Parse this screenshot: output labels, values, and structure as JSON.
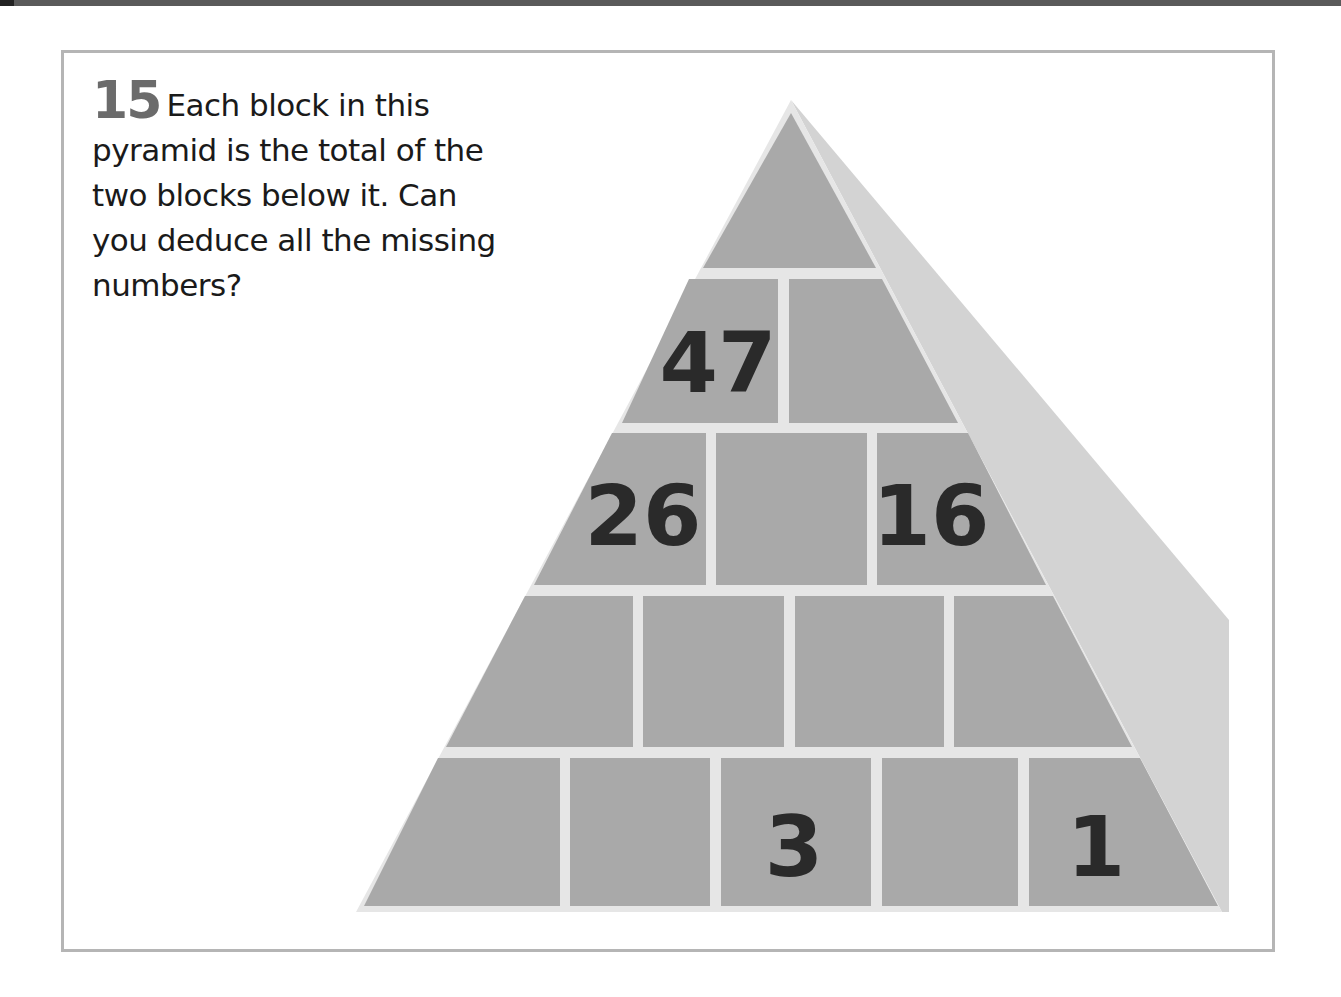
{
  "puzzle": {
    "number": "15",
    "text": "Each block in this pyramid is the total of the two blocks below it. Can you deduce all the missing numbers?",
    "lines": [
      "Each block in this",
      "pyramid is the total of the",
      "two blocks below it. Can",
      "you deduce all the missing",
      "numbers?"
    ]
  },
  "pyramid": {
    "rows": [
      {
        "row": 1,
        "cells": [
          ""
        ]
      },
      {
        "row": 2,
        "cells": [
          "47",
          ""
        ]
      },
      {
        "row": 3,
        "cells": [
          "26",
          "",
          "16"
        ]
      },
      {
        "row": 4,
        "cells": [
          "",
          "",
          "",
          ""
        ]
      },
      {
        "row": 5,
        "cells": [
          "",
          "",
          "3",
          "",
          "1"
        ]
      }
    ]
  },
  "colors": {
    "block_fill": "#a9a9a9",
    "side_face": "#d3d3d3",
    "mortar": "#e6e6e6",
    "digit": "#2a2a2a",
    "frame_border": "#b5b5b5"
  }
}
